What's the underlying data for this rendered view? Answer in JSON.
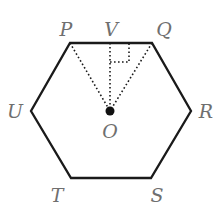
{
  "diagram": {
    "type": "regular hexagon with center and altitude",
    "colors": {
      "line": "#1a1a1a",
      "label": "#6f6f6f",
      "background": "#ffffff"
    },
    "vertices": [
      {
        "name": "P",
        "x": 70,
        "y": 43
      },
      {
        "name": "Q",
        "x": 152,
        "y": 43
      },
      {
        "name": "R",
        "x": 191,
        "y": 111
      },
      {
        "name": "S",
        "x": 151,
        "y": 178
      },
      {
        "name": "T",
        "x": 71,
        "y": 178
      },
      {
        "name": "U",
        "x": 31,
        "y": 111
      }
    ],
    "points": [
      {
        "name": "V",
        "x": 110,
        "y": 43
      },
      {
        "name": "O",
        "x": 110,
        "y": 111
      }
    ],
    "labels": {
      "P": "P",
      "V": "V",
      "Q": "Q",
      "R": "R",
      "S": "S",
      "T": "T",
      "U": "U",
      "O": "O"
    },
    "dotted_segments": [
      "PO",
      "QO",
      "VO"
    ],
    "right_angle_marker": "at V between VO and VQ"
  }
}
